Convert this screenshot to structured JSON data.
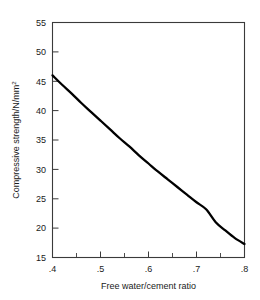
{
  "chart_data": {
    "type": "line",
    "title": "",
    "subtitle": "",
    "xlabel": "Free water/cement ratio",
    "ylabel": "Compressive strength/N/mm",
    "ylabel_superscript": "2",
    "ylabel_full": "Compressive strength/N/mm²",
    "xlim": [
      0.4,
      0.8
    ],
    "ylim": [
      15,
      55
    ],
    "grid": false,
    "legend": null,
    "legend_position": "none",
    "x_major_ticks": [
      0.4,
      0.5,
      0.6,
      0.7,
      0.8
    ],
    "x_major_tick_labels": [
      ".4",
      ".5",
      ".6",
      ".7",
      ".8"
    ],
    "x_minor_ticks": [
      0.45,
      0.55,
      0.65,
      0.75
    ],
    "y_major_ticks": [
      15,
      20,
      25,
      30,
      35,
      40,
      45,
      50,
      55
    ],
    "y_major_tick_labels": [
      "15",
      "20",
      "25",
      "30",
      "35",
      "40",
      "45",
      "50",
      "55"
    ],
    "series": [
      {
        "name": "Compressive strength",
        "color": "#000000",
        "x": [
          0.4,
          0.42,
          0.44,
          0.46,
          0.48,
          0.5,
          0.52,
          0.54,
          0.56,
          0.58,
          0.6,
          0.62,
          0.64,
          0.66,
          0.68,
          0.7,
          0.72,
          0.74,
          0.76,
          0.78,
          0.8
        ],
        "values": [
          46.0,
          44.4,
          42.9,
          41.3,
          39.8,
          38.3,
          36.8,
          35.3,
          33.9,
          32.4,
          31.0,
          29.6,
          28.3,
          27.0,
          25.7,
          24.4,
          23.2,
          21.0,
          19.6,
          18.3,
          17.3
        ]
      }
    ],
    "annotations": []
  },
  "axis_colors": {
    "frame": "#3a3a3a",
    "curve": "#000000",
    "text": "#1a1a1a",
    "background": "#ffffff"
  }
}
